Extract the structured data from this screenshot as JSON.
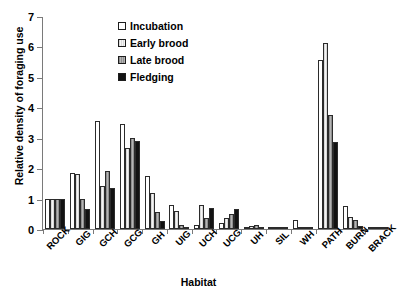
{
  "chart_data": {
    "type": "bar",
    "title": "",
    "xlabel": "Habitat",
    "ylabel": "Relative density of foraging use",
    "ylim": [
      0,
      7
    ],
    "yticks": [
      0,
      1,
      2,
      3,
      4,
      5,
      6,
      7
    ],
    "grid": false,
    "legend_position": "top-left-inside",
    "categories": [
      "ROCK",
      "GIG",
      "GCH",
      "GCG",
      "GH",
      "UIG",
      "UCH",
      "UCG",
      "UH",
      "SIL",
      "WH",
      "PATH",
      "BURN",
      "BRACK"
    ],
    "series": [
      {
        "name": "Incubation",
        "color": "#ffffff",
        "values": [
          1.0,
          1.85,
          3.55,
          3.45,
          1.75,
          0.8,
          0.12,
          0.2,
          0.05,
          0.02,
          0.28,
          5.55,
          0.75,
          0.06
        ]
      },
      {
        "name": "Early brood",
        "color": "#e3e3e3",
        "values": [
          1.0,
          1.8,
          1.4,
          2.65,
          1.2,
          0.6,
          0.8,
          0.35,
          0.1,
          0.02,
          0.05,
          6.1,
          0.4,
          0.05
        ]
      },
      {
        "name": "Late brood",
        "color": "#9e9e9e",
        "values": [
          1.0,
          1.0,
          1.9,
          3.0,
          0.55,
          0.12,
          0.35,
          0.5,
          0.12,
          0.02,
          0.04,
          3.75,
          0.3,
          0.04
        ]
      },
      {
        "name": "Fledging",
        "color": "#121212",
        "values": [
          1.0,
          0.65,
          1.35,
          2.9,
          0.25,
          0.05,
          0.7,
          0.65,
          0.08,
          0.02,
          0.03,
          2.85,
          0.1,
          0.03
        ]
      }
    ]
  },
  "axes": {
    "ylabel": "Relative density of foraging use",
    "xlabel": "Habitat",
    "ytick_labels": [
      "0",
      "1",
      "2",
      "3",
      "4",
      "5",
      "6",
      "7"
    ],
    "xtick_labels": [
      "ROCK",
      "GIG",
      "GCH",
      "GCG",
      "GH",
      "UIG",
      "UCH",
      "UCG",
      "UH",
      "SIL",
      "WH",
      "PATH",
      "BURN",
      "BRACK"
    ]
  },
  "legend": {
    "items": [
      {
        "label": "Incubation"
      },
      {
        "label": "Early brood"
      },
      {
        "label": "Late brood"
      },
      {
        "label": "Fledging"
      }
    ]
  }
}
